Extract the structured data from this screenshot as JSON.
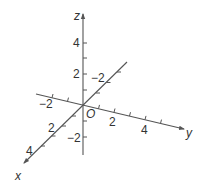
{
  "diagram": {
    "type": "3d-coordinate-axes",
    "origin_label": "O",
    "axes": {
      "x": {
        "label": "x",
        "tick_labels": [
          "2",
          "4"
        ]
      },
      "y": {
        "label": "y",
        "tick_labels": [
          "-2",
          "2",
          "4"
        ]
      },
      "z": {
        "label": "z",
        "tick_labels": [
          "4",
          "2",
          "-2"
        ]
      },
      "x_neg": {
        "tick_labels": [
          "-2"
        ]
      }
    },
    "labels": {
      "z_axis": "z",
      "y_axis": "y",
      "x_axis": "x",
      "origin": "O",
      "z_4": "4",
      "z_2": "2",
      "z_neg2": "−2",
      "y_neg2": "−2",
      "y_2": "2",
      "y_4": "4",
      "x_neg2": "−2",
      "x_2": "2",
      "x_4": "4"
    },
    "colors": {
      "axis": "#555555",
      "text": "#333333",
      "background": "#ffffff"
    }
  }
}
